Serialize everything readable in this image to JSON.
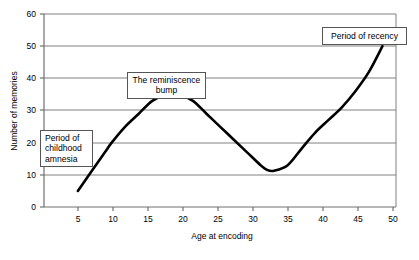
{
  "chart_data": {
    "type": "line",
    "title": "",
    "xlabel": "Age at encoding",
    "ylabel": "Number of memories",
    "xlim": [
      0,
      52
    ],
    "ylim": [
      0,
      60
    ],
    "grid": true,
    "legend": "none",
    "x_ticks": [
      5,
      10,
      15,
      20,
      25,
      30,
      35,
      40,
      45,
      50
    ],
    "y_ticks": [
      0,
      10,
      20,
      30,
      40,
      50,
      60
    ],
    "series": [
      {
        "name": "Number of memories by age at encoding",
        "x": [
          5,
          7,
          9,
          10,
          12,
          14,
          16,
          18,
          19,
          20,
          22,
          24,
          26,
          28,
          30,
          32,
          33,
          34,
          36,
          38,
          40,
          42,
          44,
          46,
          48,
          50
        ],
        "values": [
          5,
          11,
          17,
          20,
          25,
          29,
          33,
          35,
          35.2,
          35,
          33,
          29,
          25,
          21,
          17,
          13,
          11.5,
          11.3,
          13,
          18,
          23,
          27,
          31,
          36,
          42,
          50
        ]
      }
    ],
    "annotations": [
      {
        "id": "childhood-amnesia",
        "text": "Period of\nchildhood\namnesia",
        "anchor_x": 6,
        "anchor_y": 20
      },
      {
        "id": "reminiscence-bump",
        "text": "The reminiscence\nbump",
        "anchor_x": 18,
        "anchor_y": 40
      },
      {
        "id": "period-recency",
        "text": "Period of recency",
        "anchor_x": 47,
        "anchor_y": 53
      }
    ]
  },
  "axes": {
    "x_title": "Age at encoding",
    "y_title": "Number of memories",
    "x_tick_labels": [
      "5",
      "10",
      "15",
      "20",
      "25",
      "30",
      "35",
      "40",
      "45",
      "50"
    ],
    "y_tick_labels": [
      "0",
      "10",
      "20",
      "30",
      "40",
      "50",
      "60"
    ]
  },
  "annotations": {
    "childhood_amnesia": "Period of\nchildhood\namnesia",
    "reminiscence_bump": "The reminiscence\nbump",
    "period_recency": "Period of recency"
  },
  "colors": {
    "line": "#000000",
    "grid": "#808080",
    "frame": "#808080",
    "callout_border": "#555555",
    "background": "#ffffff"
  }
}
